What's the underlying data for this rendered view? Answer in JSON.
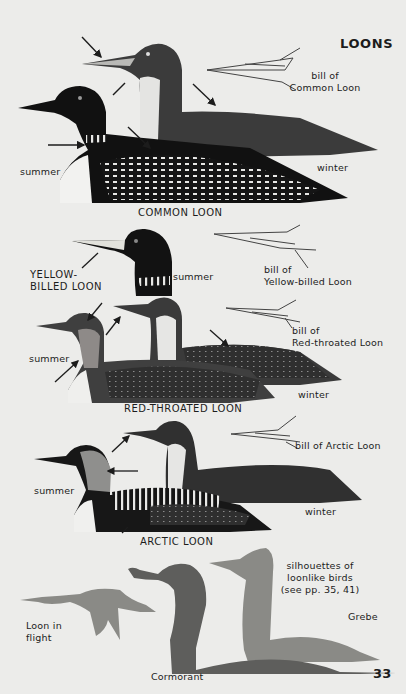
{
  "page": {
    "title": "LOONS",
    "page_number": "33",
    "colors": {
      "paper": "#ececea",
      "ink": "#1c1c1c",
      "silhouette_light": "#8a8a86",
      "silhouette_dark": "#5e5e5c"
    }
  },
  "common_loon": {
    "caption": "COMMON LOON",
    "summer_label": "summer",
    "winter_label": "winter",
    "bill_label_line1": "bill of",
    "bill_label_line2": "Common Loon"
  },
  "yellow_billed_loon": {
    "name_line1": "YELLOW-",
    "name_line2": "BILLED LOON",
    "summer_label": "summer",
    "bill_label_line1": "bill of",
    "bill_label_line2": "Yellow-billed Loon"
  },
  "red_throated_loon": {
    "caption": "RED-THROATED LOON",
    "summer_label": "summer",
    "winter_label": "winter",
    "bill_label_line1": "bill of",
    "bill_label_line2": "Red-throated Loon"
  },
  "arctic_loon": {
    "caption": "ARCTIC LOON",
    "summer_label": "summer",
    "winter_label": "winter",
    "bill_label": "bill of Arctic Loon"
  },
  "silhouettes": {
    "caption_line1": "silhouettes of",
    "caption_line2": "loonlike birds",
    "caption_line3": "(see pp. 35, 41)",
    "loon_flight_line1": "Loon in",
    "loon_flight_line2": "flight",
    "grebe_label": "Grebe",
    "cormorant_label": "Cormorant"
  }
}
